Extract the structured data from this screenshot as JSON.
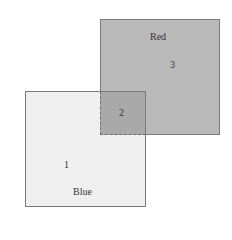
{
  "diagram": {
    "type": "overlapping-squares",
    "shapes": [
      {
        "id": "red",
        "label": "Red",
        "region_number": "3",
        "fill": "#b9b9b9"
      },
      {
        "id": "blue",
        "label": "Blue",
        "region_number": "1",
        "fill": "#efefef"
      }
    ],
    "overlap": {
      "region_number": "2",
      "fill": "#a9a9a9"
    },
    "border_color": "#7a7a7a"
  }
}
